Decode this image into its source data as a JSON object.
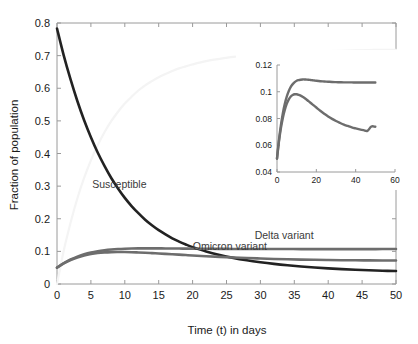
{
  "chart_data": {
    "type": "line",
    "title": "",
    "xlabel": "Time (t) in days",
    "ylabel": "Fraction of population",
    "xlim": [
      0,
      50
    ],
    "ylim": [
      0,
      0.8
    ],
    "xticks": [
      0,
      5,
      10,
      15,
      20,
      25,
      30,
      35,
      40,
      45,
      50
    ],
    "xtick_labels": [
      "0",
      "5",
      "10",
      "15",
      "20",
      "25",
      "30",
      "35",
      "40",
      "45",
      "50"
    ],
    "yticks": [
      0,
      0.1,
      0.2,
      0.3,
      0.4,
      0.5,
      0.6,
      0.7,
      0.8
    ],
    "ytick_labels": [
      "0",
      "0.1",
      "0.2",
      "0.3",
      "0.4",
      "0.5",
      "0.6",
      "0.7",
      "0.8"
    ],
    "grid": false,
    "legend_position": "inline-annotations",
    "x": [
      0,
      1,
      2,
      3,
      4,
      5,
      6,
      7,
      8,
      9,
      10,
      11,
      12,
      13,
      14,
      15,
      16,
      17,
      18,
      19,
      20,
      22,
      24,
      26,
      28,
      30,
      32,
      34,
      36,
      38,
      40,
      42,
      44,
      46,
      48,
      50
    ],
    "series": [
      {
        "name": "Susceptible",
        "color": "#222222",
        "width": 2.6,
        "annotation": "Susceptible",
        "annotation_xy": [
          9.2,
          0.295
        ],
        "values": [
          0.783,
          0.7,
          0.627,
          0.561,
          0.502,
          0.45,
          0.403,
          0.362,
          0.325,
          0.293,
          0.264,
          0.239,
          0.217,
          0.197,
          0.18,
          0.165,
          0.152,
          0.14,
          0.13,
          0.121,
          0.113,
          0.0995,
          0.0888,
          0.08,
          0.0728,
          0.0668,
          0.0617,
          0.0574,
          0.0537,
          0.0505,
          0.0478,
          0.0455,
          0.0436,
          0.042,
          0.0407,
          0.0397
        ]
      },
      {
        "name": "Delta variant",
        "color": "#6d6d6d",
        "width": 2.6,
        "annotation": "Delta variant",
        "annotation_xy": [
          33.5,
          0.138
        ],
        "values": [
          0.05,
          0.064,
          0.075,
          0.084,
          0.091,
          0.0965,
          0.1005,
          0.1035,
          0.1057,
          0.1072,
          0.1082,
          0.1088,
          0.1091,
          0.1092,
          0.1092,
          0.1091,
          0.109,
          0.1088,
          0.1086,
          0.1084,
          0.1082,
          0.1079,
          0.1077,
          0.1075,
          0.1073,
          0.1072,
          0.1071,
          0.1071,
          0.107,
          0.107,
          0.107,
          0.107,
          0.107,
          0.107,
          0.1071,
          0.1071
        ]
      },
      {
        "name": "Omicron variant",
        "color": "#6d6d6d",
        "width": 2.6,
        "annotation": "Omicron variant",
        "annotation_xy": [
          25.5,
          0.104
        ],
        "values": [
          0.05,
          0.063,
          0.073,
          0.081,
          0.0872,
          0.0917,
          0.0949,
          0.0968,
          0.0978,
          0.0981,
          0.098,
          0.0975,
          0.0967,
          0.0958,
          0.0947,
          0.0935,
          0.0923,
          0.0911,
          0.0899,
          0.0887,
          0.0875,
          0.0852,
          0.0831,
          0.0812,
          0.0795,
          0.0781,
          0.0768,
          0.0757,
          0.0748,
          0.0741,
          0.0735,
          0.073,
          0.0727,
          0.0724,
          0.0722,
          0.0721
        ]
      },
      {
        "name": "Recovered",
        "color": "#f4f4f4",
        "width": 2.2,
        "annotation": "",
        "annotation_xy": null,
        "values": [
          0.0,
          0.103,
          0.188,
          0.262,
          0.325,
          0.379,
          0.425,
          0.465,
          0.499,
          0.528,
          0.553,
          0.574,
          0.593,
          0.609,
          0.622,
          0.634,
          0.644,
          0.653,
          0.661,
          0.667,
          0.673,
          0.683,
          0.69,
          0.696,
          0.7,
          0.704,
          0.707,
          0.709,
          0.711,
          0.713,
          0.714,
          0.715,
          0.716,
          0.717,
          0.718,
          0.718
        ]
      }
    ],
    "inset": {
      "xlabel": "",
      "ylabel": "",
      "xlim": [
        0,
        60
      ],
      "ylim": [
        0.04,
        0.12
      ],
      "xticks": [
        0,
        20,
        40,
        60
      ],
      "xtick_labels": [
        "0",
        "20",
        "40",
        "60"
      ],
      "yticks": [
        0.04,
        0.06,
        0.08,
        0.1,
        0.12
      ],
      "ytick_labels": [
        "0.04",
        "0.06",
        "0.08",
        "0.1",
        "0.12"
      ],
      "grid": false,
      "x": [
        0,
        1,
        2,
        3,
        4,
        5,
        6,
        7,
        8,
        9,
        10,
        11,
        12,
        13,
        14,
        15,
        16,
        17,
        18,
        19,
        20,
        22,
        24,
        26,
        28,
        30,
        32,
        34,
        36,
        38,
        40,
        42,
        44,
        46,
        48,
        50
      ],
      "series": [
        {
          "name": "Delta variant",
          "color": "#6d6d6d",
          "width": 2.4,
          "values": [
            0.05,
            0.064,
            0.0752,
            0.0842,
            0.0912,
            0.0966,
            0.1006,
            0.1036,
            0.1057,
            0.1072,
            0.1082,
            0.1087,
            0.109,
            0.1092,
            0.1092,
            0.1091,
            0.109,
            0.1088,
            0.1086,
            0.1084,
            0.1082,
            0.1079,
            0.1077,
            0.1075,
            0.1073,
            0.1072,
            0.1071,
            0.107,
            0.107,
            0.107,
            0.1069,
            0.1069,
            0.1069,
            0.1069,
            0.1069,
            0.1069
          ]
        },
        {
          "name": "Omicron variant",
          "color": "#6d6d6d",
          "width": 2.4,
          "values": [
            0.05,
            0.0628,
            0.0728,
            0.0806,
            0.0866,
            0.0911,
            0.0943,
            0.0964,
            0.0976,
            0.0981,
            0.0981,
            0.0977,
            0.0971,
            0.0963,
            0.0953,
            0.0942,
            0.093,
            0.0918,
            0.0906,
            0.0894,
            0.0882,
            0.0858,
            0.0836,
            0.0815,
            0.0797,
            0.0781,
            0.0767,
            0.0754,
            0.0744,
            0.0734,
            0.0726,
            0.0719,
            0.0713,
            0.0708,
            0.074,
            0.0738
          ]
        }
      ]
    }
  }
}
